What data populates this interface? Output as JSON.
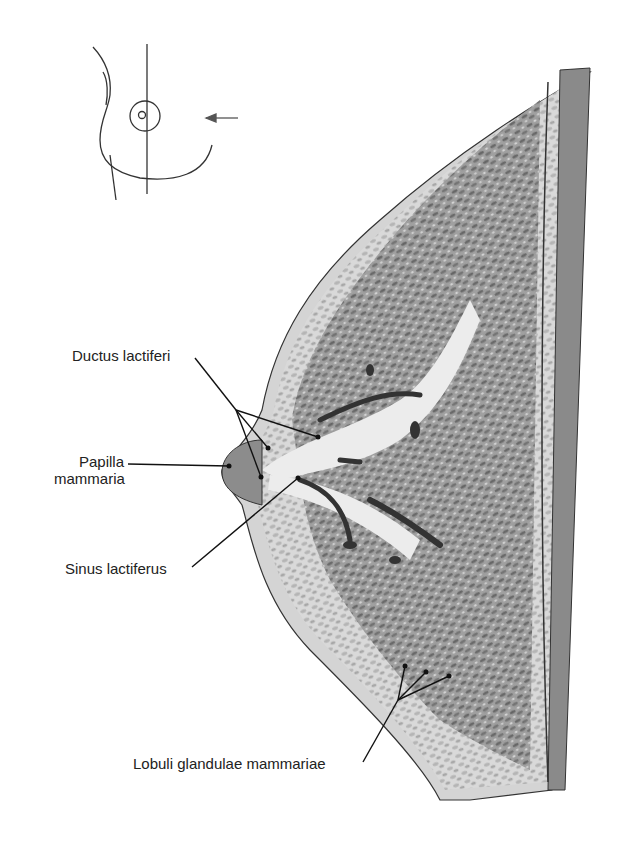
{
  "figure": {
    "type": "anatomical-illustration",
    "orientation_inset": {
      "description": "frontal outline of breast with vertical section line and arrow indicating view direction"
    }
  },
  "labels": [
    {
      "id": "ductus",
      "text": "Ductus lactiferi"
    },
    {
      "id": "papilla_1",
      "text": "Papilla"
    },
    {
      "id": "papilla_2",
      "text": "mammaria"
    },
    {
      "id": "sinus",
      "text": "Sinus lactiferus"
    },
    {
      "id": "lobuli",
      "text": "Lobuli glandulae mammariae"
    }
  ],
  "colors": {
    "line": "#1a1a1a",
    "tissue_dark": "#6b6b6b",
    "tissue_mid": "#a8a8a8",
    "tissue_light": "#e6e6e6",
    "skin": "#cfcfcf",
    "muscle": "#8a8a8a"
  }
}
